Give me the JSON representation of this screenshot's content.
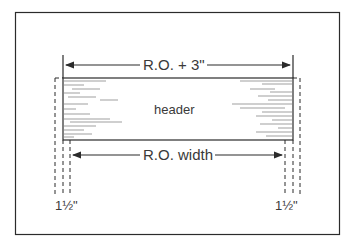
{
  "diagram": {
    "header_label": "header",
    "top_dimension": "R.O. + 3\"",
    "bottom_dimension": "R.O. width",
    "left_offset": "1½\"",
    "right_offset": "1½\""
  },
  "colors": {
    "line": "#2b2b2b",
    "text": "#3a3a3a",
    "background": "#ffffff"
  }
}
